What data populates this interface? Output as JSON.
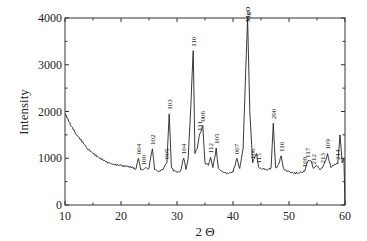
{
  "chart_data": {
    "type": "line",
    "title": "",
    "xlabel": "2 Θ",
    "ylabel": "Intensity",
    "xlim": [
      10,
      60
    ],
    "ylim": [
      0,
      4000
    ],
    "xticks": [
      10,
      20,
      30,
      40,
      50,
      60
    ],
    "yticks": [
      0,
      1000,
      2000,
      3000,
      4000
    ],
    "grid": false,
    "legend": null,
    "series": [
      {
        "name": "XRD pattern",
        "x": [
          10,
          11,
          12,
          13,
          14,
          15,
          16,
          17,
          18,
          19,
          20,
          21,
          22,
          22.7,
          23.1,
          23.5,
          24.0,
          24.4,
          25,
          25.6,
          26.0,
          26.4,
          27,
          27.5,
          28.2,
          28.6,
          29.0,
          29.4,
          30,
          30.6,
          31.2,
          31.6,
          32.0,
          32.5,
          32.9,
          33.2,
          33.6,
          34.0,
          34.6,
          35.0,
          35.6,
          36.0,
          36.4,
          37.0,
          37.4,
          38,
          39,
          40,
          40.7,
          41.2,
          41.8,
          42.2,
          42.6,
          43.0,
          43.5,
          44.2,
          44.6,
          45.2,
          46,
          46.8,
          47.2,
          47.6,
          48.0,
          48.6,
          49.0,
          50,
          51,
          52,
          52.8,
          53.3,
          53.8,
          54.4,
          54.8,
          55.4,
          56.0,
          56.4,
          56.9,
          57.5,
          58.0,
          58.7,
          59.1,
          59.5,
          59.8,
          60
        ],
        "y": [
          1950,
          1700,
          1500,
          1350,
          1200,
          1100,
          1020,
          960,
          900,
          880,
          860,
          840,
          820,
          780,
          1000,
          760,
          760,
          800,
          780,
          1200,
          760,
          740,
          720,
          760,
          900,
          1950,
          800,
          720,
          700,
          720,
          1000,
          760,
          1000,
          2200,
          3300,
          1100,
          1200,
          1500,
          1700,
          900,
          850,
          1020,
          800,
          1220,
          780,
          720,
          680,
          700,
          1000,
          780,
          1200,
          2600,
          4000,
          2000,
          900,
          1100,
          800,
          760,
          750,
          800,
          1750,
          800,
          850,
          1050,
          780,
          720,
          700,
          700,
          720,
          920,
          960,
          780,
          840,
          780,
          800,
          920,
          1100,
          800,
          850,
          880,
          1500,
          900,
          1000,
          0
        ]
      }
    ],
    "annotations": [
      {
        "label": "004",
        "x": 23.1
      },
      {
        "label": "100",
        "x": 24.0
      },
      {
        "label": "102",
        "x": 25.6
      },
      {
        "label": "005",
        "x": 28.2
      },
      {
        "label": "103",
        "x": 28.6
      },
      {
        "label": "104",
        "x": 31.2
      },
      {
        "label": "110",
        "x": 32.9
      },
      {
        "label": "111",
        "x": 34.0
      },
      {
        "label": "006",
        "x": 34.6
      },
      {
        "label": "112",
        "x": 36.0
      },
      {
        "label": "105",
        "x": 37.0
      },
      {
        "label": "007",
        "x": 40.7
      },
      {
        "label": "MgO",
        "x": 42.6
      },
      {
        "label": "106",
        "x": 43.5
      },
      {
        "label": "115",
        "x": 44.6
      },
      {
        "label": "200",
        "x": 47.2
      },
      {
        "label": "116",
        "x": 48.6
      },
      {
        "label": "108",
        "x": 52.8
      },
      {
        "label": "117",
        "x": 53.3
      },
      {
        "label": "212",
        "x": 54.4
      },
      {
        "label": "213",
        "x": 56.0
      },
      {
        "label": "109",
        "x": 56.9
      },
      {
        "label": "214",
        "x": 58.7
      }
    ]
  }
}
